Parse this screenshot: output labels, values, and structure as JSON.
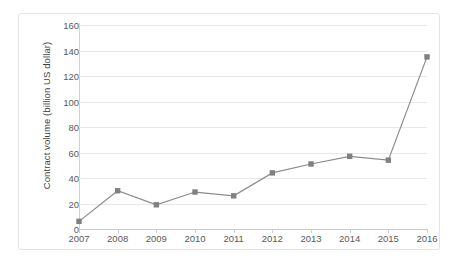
{
  "chart_data": {
    "type": "line",
    "title": "",
    "xlabel": "",
    "ylabel": "Contract volume (billion US dollar)",
    "categories": [
      "2007",
      "2008",
      "2009",
      "2010",
      "2011",
      "2012",
      "2013",
      "2014",
      "2015",
      "2016"
    ],
    "values": [
      6,
      30,
      19,
      29,
      26,
      44,
      51,
      57,
      54,
      135
    ],
    "series": [
      {
        "name": "Contract volume",
        "values": [
          6,
          30,
          19,
          29,
          26,
          44,
          51,
          57,
          54,
          135
        ]
      }
    ],
    "ylim": [
      0,
      160
    ],
    "yticks": [
      0,
      20,
      40,
      60,
      80,
      100,
      120,
      140,
      160
    ],
    "ytick_labels": [
      "0",
      "20",
      "40",
      "60",
      "80",
      "100",
      "120",
      "140",
      "160"
    ],
    "grid": true,
    "grid_axis": "y",
    "legend": false,
    "legend_position": "none",
    "marker": "square",
    "line_color": "#8c8c8c",
    "marker_color": "#808080",
    "grid_color": "#e8e8e8",
    "axis_color": "#cfcfcf",
    "text_color": "#5a5a5a",
    "background_color": "#ffffff",
    "border_color": "#e4e4e4"
  }
}
